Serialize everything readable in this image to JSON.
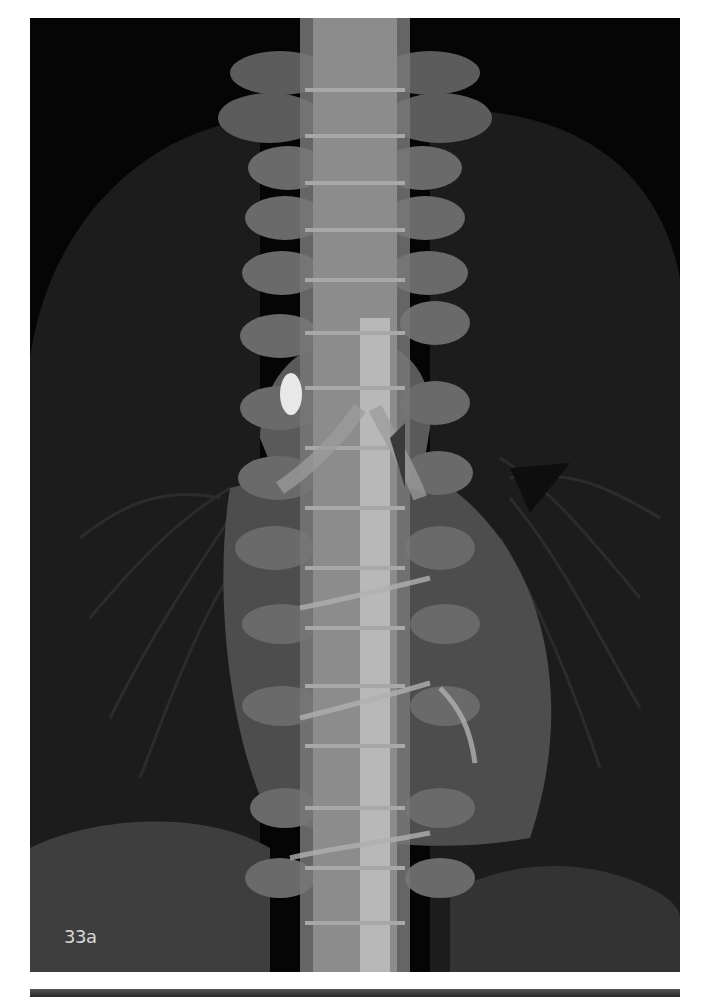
{
  "figure": {
    "label": "33a",
    "colors": {
      "background": "#050505",
      "lung_field": "#1b1b1b",
      "soft_tissue": "#4a4a4a",
      "bone": "#8a8a8a",
      "bright_bone": "#c8c8c8",
      "nodule": "#e8e8e8",
      "label_text": "#d8d8d8"
    }
  }
}
